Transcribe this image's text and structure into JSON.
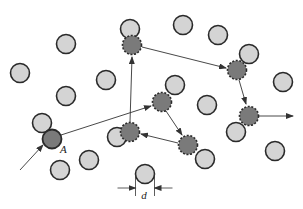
{
  "diagram": {
    "title": "",
    "labels": {
      "start_particle": "A",
      "diameter": "d"
    },
    "colors": {
      "background": "#ffffff",
      "particle_fill": "#d4d4d4",
      "particle_stroke": "#2a2a2a",
      "path_particle_fill": "#7a7a7a",
      "start_particle_fill": "#7a7a7a",
      "arrow_color": "#333333"
    },
    "radius": 9.5,
    "particles": [
      {
        "x": 66,
        "y": 44
      },
      {
        "x": 20,
        "y": 73
      },
      {
        "x": 106,
        "y": 80
      },
      {
        "x": 66,
        "y": 96
      },
      {
        "x": 130,
        "y": 29
      },
      {
        "x": 183,
        "y": 25
      },
      {
        "x": 218,
        "y": 35
      },
      {
        "x": 249,
        "y": 54
      },
      {
        "x": 283,
        "y": 82
      },
      {
        "x": 207,
        "y": 105
      },
      {
        "x": 175,
        "y": 85
      },
      {
        "x": 42,
        "y": 123
      },
      {
        "x": 117,
        "y": 137
      },
      {
        "x": 60,
        "y": 170
      },
      {
        "x": 89,
        "y": 160
      },
      {
        "x": 236,
        "y": 132
      },
      {
        "x": 205,
        "y": 159
      },
      {
        "x": 275,
        "y": 151
      },
      {
        "x": 145,
        "y": 174
      }
    ],
    "start_particle": {
      "x": 52,
      "y": 139
    },
    "path_particles": [
      {
        "x": 132,
        "y": 45
      },
      {
        "x": 237,
        "y": 70
      },
      {
        "x": 249,
        "y": 116
      },
      {
        "x": 162,
        "y": 102
      },
      {
        "x": 188,
        "y": 145
      },
      {
        "x": 130,
        "y": 132
      }
    ],
    "path_arrows": [
      {
        "x1": 20,
        "y1": 170,
        "x2": 43,
        "y2": 145
      },
      {
        "x1": 61,
        "y1": 135,
        "x2": 151,
        "y2": 106
      },
      {
        "x1": 130,
        "y1": 122,
        "x2": 132,
        "y2": 57
      },
      {
        "x1": 142,
        "y1": 47,
        "x2": 226,
        "y2": 68
      },
      {
        "x1": 239,
        "y1": 80,
        "x2": 246,
        "y2": 104
      },
      {
        "x1": 259,
        "y1": 116,
        "x2": 293,
        "y2": 116
      },
      {
        "x1": 166,
        "y1": 111,
        "x2": 182,
        "y2": 135
      },
      {
        "x1": 178,
        "y1": 143,
        "x2": 141,
        "y2": 134
      }
    ],
    "dimension": {
      "left_x": 135.5,
      "right_x": 154.5,
      "y": 188,
      "label_x": 144,
      "label_y": 199
    }
  }
}
